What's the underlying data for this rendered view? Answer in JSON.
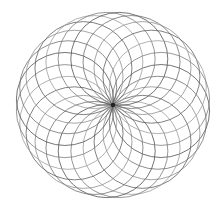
{
  "artwork": {
    "subject": "circle rosette drawing",
    "background": "#ffffff",
    "center": {
      "x": 113,
      "y": 105
    },
    "envelope_radius_x": 97,
    "envelope_radius_y": 93,
    "circle_count": 24,
    "circle_radius_x": 48.5,
    "circle_radius_y": 46.5,
    "stroke_colors": [
      "#4a4a4a",
      "#6a6a6a",
      "#8a8a8a",
      "#5a5a5a",
      "#9a9a9a",
      "#777777"
    ],
    "stroke_width": 0.9,
    "center_dot_color": "#222222",
    "center_dot_radius": 2.2
  }
}
